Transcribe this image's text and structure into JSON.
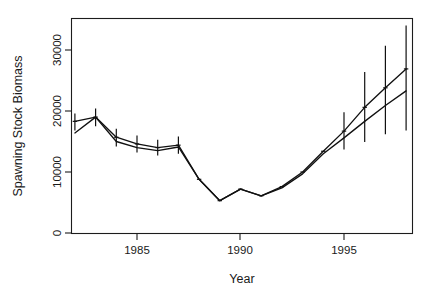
{
  "chart_data": {
    "type": "line",
    "title": "",
    "xlabel": "Year",
    "ylabel": "Spawning Stock Biomass",
    "xlim": [
      1981.6,
      1998.9
    ],
    "ylim": [
      0,
      34500
    ],
    "grid": false,
    "legend": "none",
    "x_ticks": [
      1985,
      1990,
      1995
    ],
    "x_tick_labels": [
      "1985",
      "1990",
      "1995"
    ],
    "y_ticks": [
      0,
      10000,
      20000,
      30000
    ],
    "y_tick_labels": [
      "0",
      "10000",
      "20000",
      "30000"
    ],
    "x": [
      1982,
      1983,
      1984,
      1985,
      1986,
      1987,
      1988,
      1989,
      1990,
      1991,
      1992,
      1993,
      1994,
      1995,
      1996,
      1997,
      1998
    ],
    "series": [
      {
        "name": "Estimated SSB (with error bars)",
        "values": [
          18300,
          19000,
          15700,
          14600,
          14000,
          14400,
          8800,
          5300,
          7200,
          6100,
          7600,
          10000,
          13400,
          16700,
          20600,
          23800,
          26900
        ],
        "has_error_bars": true,
        "error_lower": [
          16800,
          17500,
          14200,
          13200,
          12700,
          13000,
          8800,
          5300,
          7200,
          6100,
          7600,
          10000,
          13400,
          13700,
          14900,
          16200,
          16800
        ],
        "error_upper": [
          19600,
          20400,
          17100,
          16000,
          15300,
          15800,
          8800,
          5300,
          7200,
          6100,
          7600,
          10000,
          13400,
          19800,
          26400,
          30700,
          34000
        ]
      },
      {
        "name": "Alternative SSB estimate",
        "values": [
          16400,
          19000,
          15000,
          14000,
          13500,
          14100,
          8800,
          5300,
          7200,
          6100,
          7400,
          9700,
          13000,
          15600,
          18300,
          20900,
          23300
        ],
        "has_error_bars": false
      }
    ]
  }
}
